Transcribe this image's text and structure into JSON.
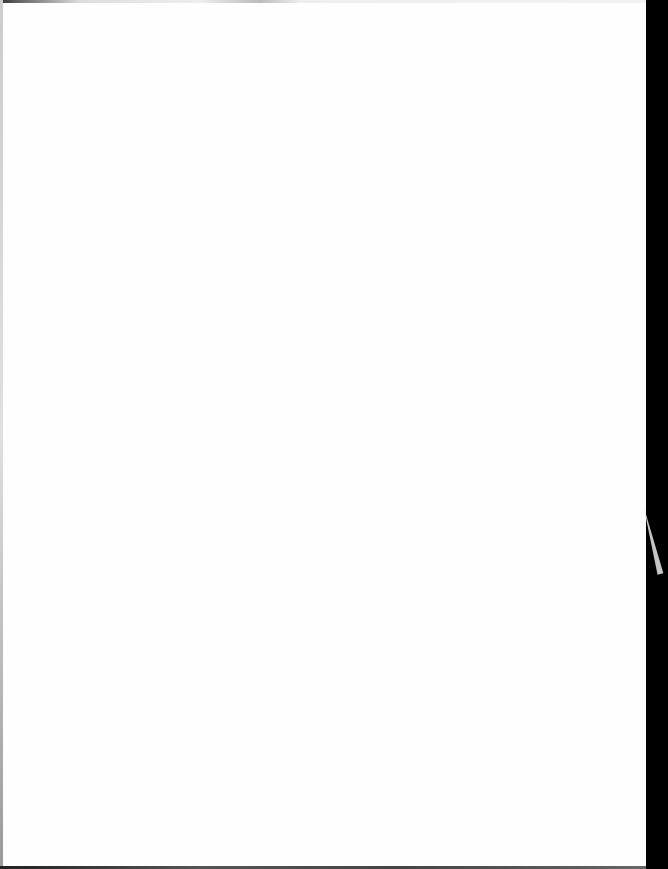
{
  "document": {
    "type": "scanned-page",
    "content": "",
    "colors": {
      "paper": "#fefefe",
      "scan_border": "#000000"
    }
  }
}
